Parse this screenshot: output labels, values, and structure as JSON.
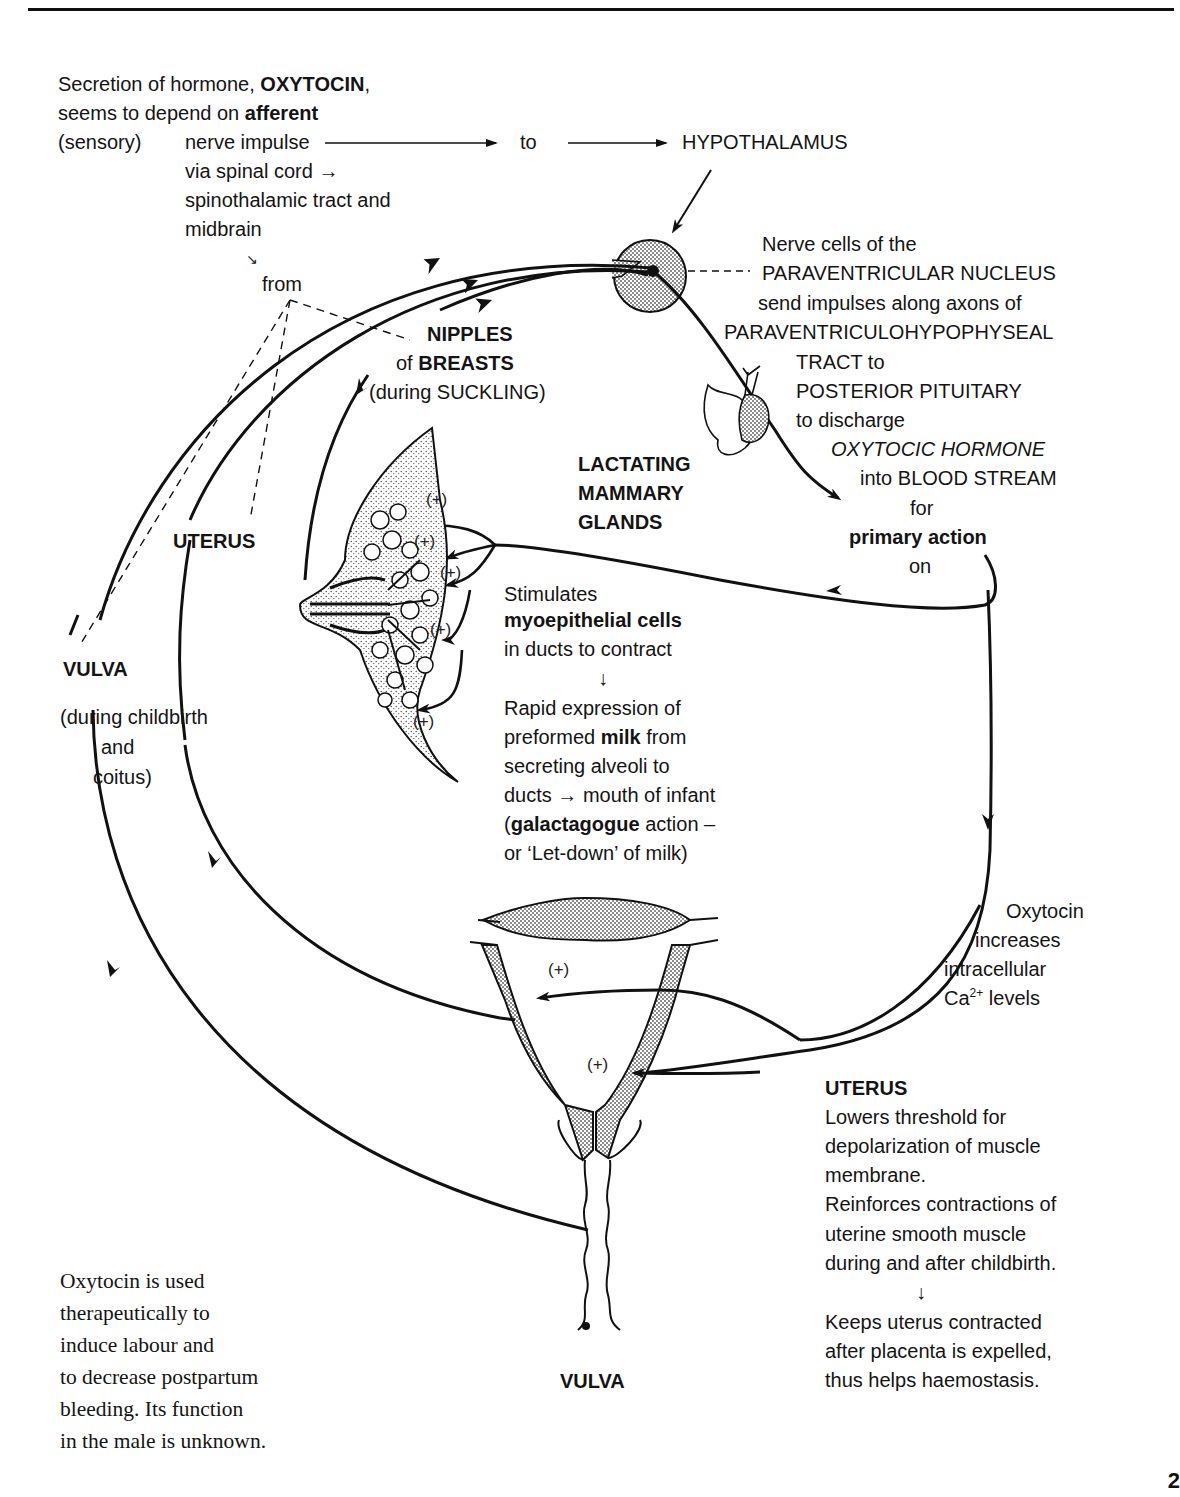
{
  "intro": {
    "line1_pre": "Secretion of hormone, ",
    "line1_bold": "OXYTOCIN",
    "line1_post": ",",
    "line2_pre": "seems to depend on ",
    "line2_bold": "afferent",
    "line3_a": "(sensory)",
    "line3_b": "nerve impulse",
    "to": "to",
    "via": "via spinal cord →",
    "tract": "spinothalamic tract and",
    "midbrain": "midbrain",
    "small_arrow": "↘",
    "from": "from"
  },
  "hypothalamus": {
    "label": "HYPOTHALAMUS"
  },
  "paraventricular": {
    "lines": [
      "Nerve cells of the",
      "PARAVENTRICULAR  NUCLEUS",
      "send impulses along axons of",
      "PARAVENTRICULOHYPOPHYSEAL",
      "TRACT to",
      "POSTERIOR PITUITARY",
      "to discharge"
    ],
    "hormone": "OXYTOCIC HORMONE",
    "blood": "into BLOOD STREAM",
    "for": "for",
    "primary": "primary action",
    "on": "on"
  },
  "nipples": {
    "title": "NIPPLES",
    "of": "of ",
    "breasts": "BREASTS",
    "during": "(during SUCKLING)"
  },
  "mammary": {
    "title_lines": [
      "LACTATING",
      "MAMMARY",
      "GLANDS"
    ],
    "plus_sign": "(+)"
  },
  "stimulates": {
    "line1": "Stimulates",
    "line2": "myoepithelial cells",
    "line3": "in ducts to contract",
    "arrow": "↓",
    "line4": "Rapid expression of",
    "line5_pre": "preformed ",
    "line5_bold": "milk",
    "line5_post": " from",
    "line6": "secreting alveoli to",
    "line7": "ducts → mouth of infant",
    "line8_pre": "(",
    "line8_bold": "galactagogue",
    "line8_post": " action –",
    "line9": "or ‘Let-down’ of milk)"
  },
  "left_labels": {
    "uterus": "UTERUS",
    "vulva": "VULVA",
    "during": "(during childbirth",
    "and": "and",
    "coitus": "coitus)"
  },
  "calcium": {
    "line1": "Oxytocin",
    "line2": "increases",
    "line3": "intracellular",
    "line4_pre": "Ca",
    "line4_sup": "2+",
    "line4_post": " levels"
  },
  "uterus_box": {
    "title": "UTERUS",
    "lines": [
      "Lowers threshold for",
      "depolarization of muscle",
      "membrane.",
      "Reinforces contractions of",
      "uterine smooth muscle",
      "during and after childbirth."
    ],
    "arrow": "↓",
    "lines2": [
      "Keeps uterus contracted",
      "after placenta is expelled,",
      "thus helps haemostasis."
    ]
  },
  "vulva_bottom": {
    "label": "VULVA"
  },
  "note": {
    "lines": [
      "Oxytocin is used",
      "therapeutically to",
      "induce labour and",
      "to decrease postpartum",
      "bleeding. Its function",
      "in the male is unknown."
    ]
  },
  "page_number": "2"
}
